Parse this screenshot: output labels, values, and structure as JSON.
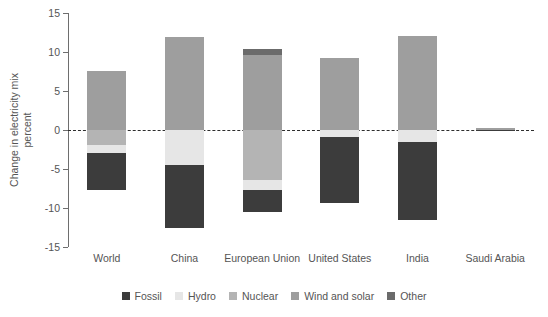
{
  "chart_data": {
    "type": "bar",
    "title": "",
    "subtitle": "",
    "xlabel": "",
    "ylabel": "Change in electricity mix",
    "ylabel_line2": "percent",
    "ylim": [
      -15,
      15
    ],
    "yticks": [
      15,
      10,
      5,
      0,
      -5,
      -10,
      -15
    ],
    "ytick_labels": [
      "15",
      "10",
      "5",
      "0",
      "-5",
      "-10",
      "-15"
    ],
    "grid": false,
    "zero_reference_line": true,
    "stacked": true,
    "legend_position": "bottom",
    "categories": [
      "World",
      "China",
      "European Union",
      "United States",
      "India",
      "Saudi Arabia"
    ],
    "series": [
      {
        "name": "Fossil",
        "color": "#3c3c3c",
        "values": [
          -4.8,
          -8.1,
          -2.8,
          -8.4,
          -9.9,
          -0.1
        ]
      },
      {
        "name": "Hydro",
        "color": "#e6e6e6",
        "values": [
          -1.0,
          -4.5,
          -1.3,
          -0.9,
          -1.6,
          0.0
        ]
      },
      {
        "name": "Nuclear",
        "color": "#b4b4b4",
        "values": [
          -1.9,
          0.0,
          -6.4,
          0.0,
          0.0,
          0.0
        ]
      },
      {
        "name": "Wind and solar",
        "color": "#9e9e9e",
        "values": [
          7.6,
          11.9,
          9.6,
          9.2,
          12.0,
          0.2
        ]
      },
      {
        "name": "Other",
        "color": "#6b6b6b",
        "values": [
          0.0,
          0.0,
          0.8,
          0.0,
          0.0,
          0.0
        ]
      }
    ],
    "totals_positive": [
      7.6,
      11.9,
      10.4,
      9.2,
      12.0,
      0.2
    ],
    "totals_negative": [
      -7.7,
      -12.6,
      -10.5,
      -9.3,
      -11.5,
      -0.1
    ]
  },
  "legend": {
    "items": [
      {
        "label": "Fossil"
      },
      {
        "label": "Hydro"
      },
      {
        "label": "Nuclear"
      },
      {
        "label": "Wind and solar"
      },
      {
        "label": "Other"
      }
    ]
  },
  "axis": {
    "y_title_line1": "Change in electricity mix",
    "y_title_line2": "percent"
  }
}
